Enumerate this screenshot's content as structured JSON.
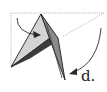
{
  "diagram": {
    "type": "origami-fold-step",
    "step_label": "d.",
    "colors": {
      "background": "#ffffff",
      "dotted_line": "#9a9a9a",
      "light_face": "#d4d4d4",
      "mid_face": "#8a8a8a",
      "dark_face": "#3c3c3c",
      "outline": "#1e1e1e",
      "arrow": "#2a2a2a"
    },
    "elements": [
      {
        "name": "dotted-outline",
        "description": "Dotted reference rectangle showing original paper edges"
      },
      {
        "name": "dotted-diagonal",
        "description": "Dotted diagonal from top-right corner"
      },
      {
        "name": "light-triangle-flap",
        "description": "Light gray triangular flap"
      },
      {
        "name": "dark-flap",
        "description": "Dark gray inner flap"
      },
      {
        "name": "long-point",
        "description": "Long pointed flap extending downward"
      },
      {
        "name": "left-curved-arrow",
        "description": "Curved arrow pointing into the triangle"
      },
      {
        "name": "right-curved-arrow",
        "description": "Long curved arrow sweeping down toward the point"
      }
    ]
  }
}
